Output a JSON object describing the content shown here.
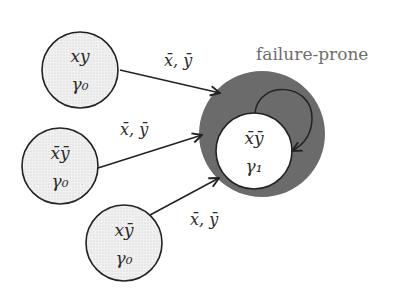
{
  "diagram": {
    "region": {
      "label": "failure-prone",
      "color": "#6b6b6b"
    },
    "nodes": [
      {
        "id": "n1",
        "state": "xy",
        "state_bars": [
          false,
          false
        ],
        "weight": "γ₀",
        "shaded": true
      },
      {
        "id": "n2",
        "state": "x̄ȳ",
        "state_bars": [
          true,
          true
        ],
        "weight": "γ₀",
        "shaded": true
      },
      {
        "id": "n3",
        "state": "xȳ",
        "state_bars": [
          false,
          true
        ],
        "weight": "γ₀",
        "shaded": true
      },
      {
        "id": "n4",
        "state": "x̄ȳ",
        "state_bars": [
          true,
          true
        ],
        "weight": "γ₁",
        "shaded": false,
        "in_region": true
      }
    ],
    "edges": [
      {
        "from": "n1",
        "to": "n4",
        "label": "x̄, ȳ"
      },
      {
        "from": "n2",
        "to": "n4",
        "label": "x̄, ȳ"
      },
      {
        "from": "n3",
        "to": "n4",
        "label": "x̄, ȳ"
      },
      {
        "from": "n4",
        "to": "n4",
        "label": "",
        "self_loop": true
      }
    ]
  }
}
